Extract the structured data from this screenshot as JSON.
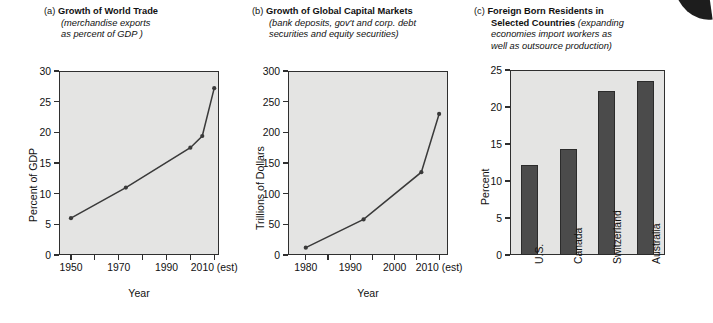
{
  "figure": {
    "panels": [
      {
        "tag": "(a)",
        "title": "Growth of World Trade",
        "subtitle_lines": [
          "(merchandise exports",
          "as percent of GDP )"
        ]
      },
      {
        "tag": "(b)",
        "title": "Growth of Global Capital Markets",
        "title_line1": "Growth of Global Capital Markets",
        "subtitle_lines": [
          "(bank deposits, gov't and corp. debt",
          "securities and equity securities)"
        ]
      },
      {
        "tag": "(c)",
        "title": "Foreign Born Residents in Selected Countries",
        "title_line1": "Foreign Born Residents in",
        "title_line2": "Selected Countries",
        "subtitle_lines": [
          "(expanding",
          "economies import workers as",
          "well as outsource production)"
        ]
      }
    ]
  },
  "chart_data": [
    {
      "type": "line",
      "panel": "a",
      "title": "Growth of World Trade",
      "xlabel": "Year",
      "ylabel": "Percent of GDP",
      "xlim": [
        1945,
        2012
      ],
      "ylim": [
        0,
        30
      ],
      "yticks": [
        0,
        5,
        10,
        15,
        20,
        25,
        30
      ],
      "ytick_labels": [
        "0",
        "5",
        "10",
        "15",
        "20",
        "25",
        "30"
      ],
      "xticks": [
        1950,
        1960,
        1970,
        1980,
        1990,
        2000,
        2010
      ],
      "xtick_labels": [
        "1950",
        "",
        "1970",
        "",
        "1990",
        "",
        "2010 (est)"
      ],
      "grid": false,
      "legend": "none",
      "x": [
        1950,
        1973,
        2000,
        2005,
        2010
      ],
      "values": [
        6.0,
        11.0,
        17.5,
        19.4,
        27.2
      ],
      "marker": "filled-circle",
      "line_color": "#3a3a3a",
      "plot_bg": "#e4e4e3"
    },
    {
      "type": "line",
      "panel": "b",
      "title": "Growth of Global Capital Markets",
      "xlabel": "Year",
      "ylabel": "Trillions of Dollars",
      "xlim": [
        1976,
        2012
      ],
      "ylim": [
        0,
        300
      ],
      "yticks": [
        0,
        50,
        100,
        150,
        200,
        250,
        300
      ],
      "ytick_labels": [
        "0",
        "50",
        "100",
        "150",
        "200",
        "250",
        "300"
      ],
      "xticks": [
        1980,
        1985,
        1990,
        1995,
        2000,
        2005,
        2010
      ],
      "xtick_labels": [
        "1980",
        "",
        "1990",
        "",
        "2000",
        "",
        "2010 (est)"
      ],
      "grid": false,
      "legend": "none",
      "x": [
        1980,
        1993,
        2006,
        2010
      ],
      "values": [
        12,
        58,
        135,
        230
      ],
      "marker": "filled-circle",
      "line_color": "#3a3a3a",
      "plot_bg": "#e4e4e3"
    },
    {
      "type": "bar",
      "panel": "c",
      "title": "Foreign Born Residents in Selected Countries",
      "xlabel": "",
      "ylabel": "Percent",
      "ylim": [
        0,
        25
      ],
      "yticks": [
        0,
        5,
        10,
        15,
        20,
        25
      ],
      "ytick_labels": [
        "0",
        "5",
        "10",
        "15",
        "20",
        "25"
      ],
      "grid": false,
      "legend": "none",
      "categories": [
        "U.S.",
        "Canada",
        "Switzerland",
        "Australia"
      ],
      "values": [
        12.1,
        14.3,
        22.1,
        23.5
      ],
      "bar_color": "#4b4b4b",
      "plot_bg": "#e4e4e3"
    }
  ]
}
